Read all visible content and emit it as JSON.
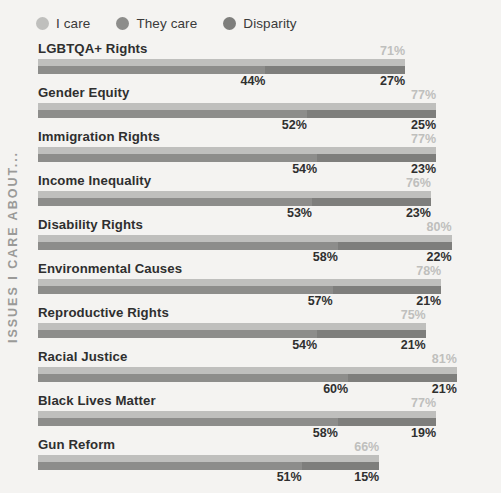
{
  "legend": {
    "items": [
      {
        "label": "I care",
        "color": "#bfbfbd",
        "icon": "circle-icon"
      },
      {
        "label": "They care",
        "color": "#8d8d8b",
        "icon": "circle-icon"
      },
      {
        "label": "Disparity",
        "color": "#7e7e7c",
        "icon": "circle-icon"
      }
    ]
  },
  "axis_title": "ISSUES I CARE ABOUT...",
  "chart_data": {
    "type": "bar",
    "orientation": "horizontal",
    "title": "",
    "xlabel": "",
    "ylabel": "ISSUES I CARE ABOUT...",
    "xlim": [
      0,
      100
    ],
    "grid": false,
    "legend_position": "top-left",
    "categories": [
      "LGBTQA+ Rights",
      "Gender Equity",
      "Immigration Rights",
      "Income Inequality",
      "Disability Rights",
      "Environmental Causes",
      "Reproductive Rights",
      "Racial Justice",
      "Black Lives Matter",
      "Gun Reform"
    ],
    "series": [
      {
        "name": "I care",
        "color": "#bfbfbd",
        "values": [
          71,
          77,
          77,
          76,
          80,
          78,
          75,
          81,
          77,
          66
        ],
        "labels": [
          "71%",
          "77%",
          "77%",
          "76%",
          "80%",
          "78%",
          "75%",
          "81%",
          "77%",
          "66%"
        ]
      },
      {
        "name": "They care",
        "color": "#8d8d8b",
        "values": [
          44,
          52,
          54,
          53,
          58,
          57,
          54,
          60,
          58,
          51
        ],
        "labels": [
          "44%",
          "52%",
          "54%",
          "53%",
          "58%",
          "57%",
          "54%",
          "60%",
          "58%",
          "51%"
        ]
      },
      {
        "name": "Disparity",
        "color": "#7e7e7c",
        "values": [
          27,
          25,
          23,
          23,
          22,
          21,
          21,
          21,
          19,
          15
        ],
        "labels": [
          "27%",
          "25%",
          "23%",
          "23%",
          "22%",
          "21%",
          "21%",
          "21%",
          "19%",
          "15%"
        ]
      }
    ]
  }
}
